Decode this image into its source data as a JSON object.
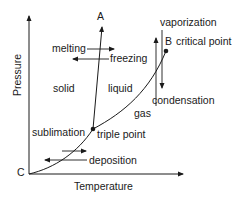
{
  "diagram": {
    "axes": {
      "x_label": "Temperature",
      "y_label": "Pressure",
      "origin_label": "C"
    },
    "points": {
      "a_label": "A",
      "b_label": "B",
      "triple_point_label": "triple point",
      "critical_point_label": "critical point"
    },
    "regions": {
      "solid": "solid",
      "liquid": "liquid",
      "gas": "gas"
    },
    "transitions": {
      "melting": "melting",
      "freezing": "freezing",
      "vaporization": "vaporization",
      "condensation": "condensation",
      "sublimation": "sublimation",
      "deposition": "deposition"
    },
    "colors": {
      "line": "#1a1a1a",
      "background": "#ffffff"
    }
  }
}
